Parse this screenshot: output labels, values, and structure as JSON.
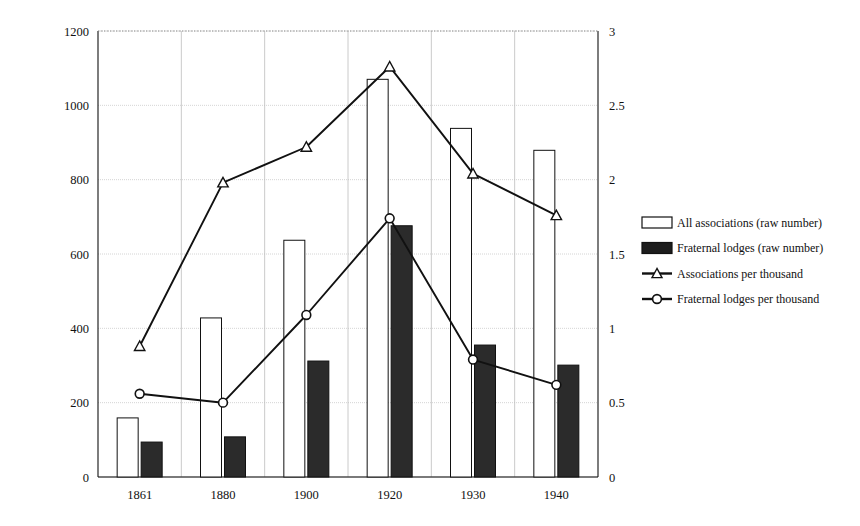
{
  "chart_data": {
    "type": "bar",
    "title": "",
    "subtitle": "",
    "xlabel": "",
    "ylabel": "",
    "categories": [
      "1861",
      "1880",
      "1900",
      "1920",
      "1930",
      "1940"
    ],
    "grid": true,
    "legend_position": "right",
    "axes": {
      "left": {
        "label": "",
        "min": 0,
        "max": 1200,
        "step": 200,
        "ticks": [
          "0",
          "200",
          "400",
          "600",
          "800",
          "1000",
          "1200"
        ]
      },
      "right": {
        "label": "",
        "min": 0,
        "max": 3,
        "step": 0.5,
        "ticks": [
          "0",
          "0.5",
          "1",
          "1.5",
          "2",
          "2.5",
          "3"
        ]
      }
    },
    "series": [
      {
        "name": "All associations (raw number)",
        "kind": "bar",
        "axis": "left",
        "fill": "#ffffff",
        "stroke": "#111111",
        "values": [
          159,
          428,
          637,
          1070,
          938,
          879
        ]
      },
      {
        "name": "Fraternal lodges (raw number)",
        "kind": "bar",
        "axis": "left",
        "fill": "#2b2b2b",
        "stroke": "#111111",
        "values": [
          94,
          108,
          312,
          676,
          355,
          301
        ]
      },
      {
        "name": "Associations per thousand",
        "kind": "line",
        "axis": "right",
        "marker": "triangle",
        "stroke": "#111111",
        "values": [
          0.88,
          1.98,
          2.22,
          2.76,
          2.04,
          1.76
        ]
      },
      {
        "name": "Fraternal lodges per thousand",
        "kind": "line",
        "axis": "right",
        "marker": "circle",
        "stroke": "#111111",
        "values": [
          0.56,
          0.5,
          1.09,
          1.74,
          0.79,
          0.62
        ]
      }
    ]
  },
  "legend": {
    "items": [
      {
        "label": "All associations (raw number)",
        "swatch": "open-square",
        "icon_name": "legend-swatch-open-square"
      },
      {
        "label": "Fraternal lodges (raw number)",
        "swatch": "filled-square",
        "icon_name": "legend-swatch-filled-square"
      },
      {
        "label": "Associations per thousand",
        "swatch": "line-triangle",
        "icon_name": "legend-marker-triangle"
      },
      {
        "label": "Fraternal lodges per thousand",
        "swatch": "line-circle",
        "icon_name": "legend-marker-circle"
      }
    ]
  }
}
